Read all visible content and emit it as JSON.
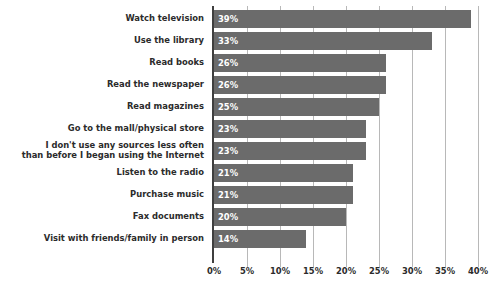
{
  "chart_data": {
    "type": "bar",
    "orientation": "horizontal",
    "title": "",
    "subtitle": "",
    "xlabel": "",
    "ylabel": "",
    "xlim": [
      0,
      40
    ],
    "xtick_labels": [
      "0%",
      "5%",
      "10%",
      "15%",
      "20%",
      "25%",
      "30%",
      "35%",
      "40%"
    ],
    "xtick_values": [
      0,
      5,
      10,
      15,
      20,
      25,
      30,
      35,
      40
    ],
    "grid": true,
    "grid_axis": "x",
    "legend": false,
    "legend_position": "none",
    "value_label_position": "inside-left",
    "bar_color": "#6b6b6b",
    "value_label_color": "#ffffff",
    "category_label_color": "#2b2b2b",
    "gridline_color": "#b8b8b8",
    "axis_color": "#3f3f3f",
    "background_color": "#ffffff",
    "categories": [
      "Watch television",
      "Use the library",
      "Read books",
      "Read the newspaper",
      "Read magazines",
      "Go to the mall/physical store",
      "I don't use any sources less often\nthan before I began using the Internet",
      "Listen to the radio",
      "Purchase music",
      "Fax documents",
      "Visit with friends/family in person"
    ],
    "values": [
      39,
      33,
      26,
      26,
      25,
      23,
      23,
      21,
      21,
      20,
      14
    ],
    "value_labels": [
      "39%",
      "33%",
      "26%",
      "26%",
      "25%",
      "23%",
      "23%",
      "21%",
      "21%",
      "20%",
      "14%"
    ]
  }
}
